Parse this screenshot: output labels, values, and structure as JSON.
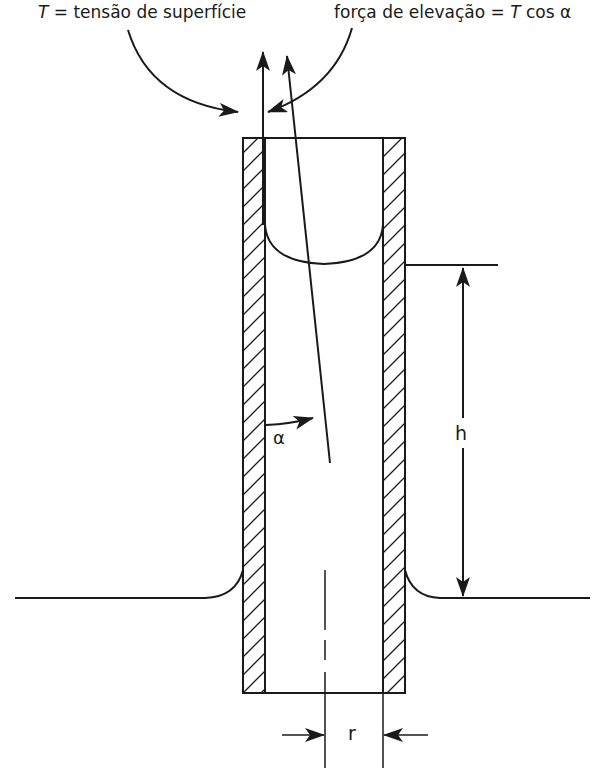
{
  "diagram": {
    "title_left": {
      "var": "T",
      "text": " = tensão de superfície"
    },
    "title_right": {
      "text": "força de elevação = ",
      "var": "T",
      "suffix": " cos α"
    },
    "angle_label": "α",
    "height_label": "h",
    "radius_label": "r",
    "colors": {
      "line": "#1a1a1a",
      "background": "#ffffff"
    }
  }
}
